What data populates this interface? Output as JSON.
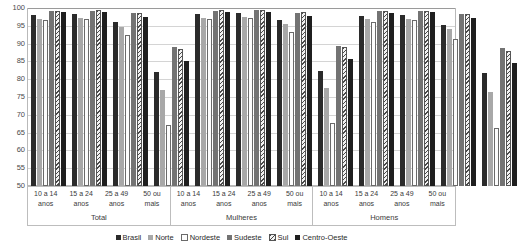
{
  "chart_data": {
    "type": "bar",
    "title": "",
    "xlabel": "",
    "ylabel": "",
    "ylim": [
      50,
      100
    ],
    "yticks": [
      100,
      95,
      90,
      85,
      80,
      75,
      70,
      65,
      60,
      55,
      50
    ],
    "grid": true,
    "legend_position": "bottom",
    "sections": [
      "Total",
      "Mulheres",
      "Homens"
    ],
    "categories": [
      "10 a 14 anos",
      "15 a 24 anos",
      "25 a 49 anos",
      "50 ou mais"
    ],
    "category_lines": [
      [
        "10 a 14",
        "anos"
      ],
      [
        "15 a 24",
        "anos"
      ],
      [
        "25 a 49",
        "anos"
      ],
      [
        "50 ou",
        "mais"
      ]
    ],
    "series": [
      {
        "name": "Brasil",
        "color": "#2b2b2b",
        "values": {
          "Total": [
            98.0,
            98.3,
            96.0,
            82.0
          ],
          "Mulheres": [
            98.2,
            98.5,
            96.6,
            82.2
          ],
          "Homens": [
            97.8,
            98.0,
            95.3,
            81.8
          ]
        }
      },
      {
        "name": "Norte",
        "color": "#a8a8a8",
        "values": {
          "Total": [
            97.0,
            97.3,
            94.8,
            77.0
          ],
          "Mulheres": [
            97.2,
            97.6,
            95.4,
            77.5
          ],
          "Homens": [
            96.8,
            97.0,
            94.0,
            76.3
          ]
        }
      },
      {
        "name": "Nordeste",
        "color": "#fdfdfd",
        "values": {
          "Total": [
            96.5,
            96.8,
            92.5,
            67.0
          ],
          "Mulheres": [
            96.8,
            97.2,
            93.4,
            67.6
          ],
          "Homens": [
            96.2,
            96.5,
            91.4,
            66.2
          ]
        }
      },
      {
        "name": "Sudeste",
        "color": "#737373",
        "values": {
          "Total": [
            99.2,
            99.3,
            98.5,
            89.0
          ],
          "Mulheres": [
            99.3,
            99.4,
            98.7,
            89.3
          ],
          "Homens": [
            99.1,
            99.2,
            98.4,
            88.7
          ]
        }
      },
      {
        "name": "Sul",
        "color": "#e8e8e8",
        "values": {
          "Total": [
            99.3,
            99.4,
            98.5,
            88.5
          ],
          "Mulheres": [
            99.4,
            99.5,
            98.8,
            89.0
          ],
          "Homens": [
            99.2,
            99.3,
            98.2,
            88.0
          ]
        }
      },
      {
        "name": "Centro-Oeste",
        "color": "#1f1f1f",
        "values": {
          "Total": [
            98.8,
            98.9,
            97.5,
            85.0
          ],
          "Mulheres": [
            98.9,
            99.0,
            97.8,
            85.6
          ],
          "Homens": [
            98.7,
            98.8,
            97.2,
            84.6
          ]
        }
      }
    ]
  }
}
